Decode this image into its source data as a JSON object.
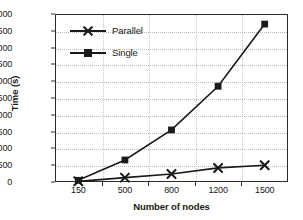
{
  "chart_data": {
    "type": "line",
    "title": "",
    "xlabel": "Number of nodes",
    "ylabel": "Time (s)",
    "categories": [
      "150",
      "500",
      "800",
      "1200",
      "1500"
    ],
    "x": [
      150,
      500,
      800,
      1200,
      1500
    ],
    "series": [
      {
        "name": "Parallel",
        "marker": "x",
        "values": [
          20,
          130,
          240,
          420,
          500
        ]
      },
      {
        "name": "Single",
        "marker": "square",
        "values": [
          50,
          655,
          1550,
          2850,
          4700
        ]
      }
    ],
    "ylim": [
      0,
      5000
    ],
    "ytick_step": 500,
    "yticks": [
      "0",
      "500",
      "1000",
      "1500",
      "2000",
      "2500",
      "3000",
      "3500",
      "4000",
      "4500",
      "5000"
    ],
    "grid": "horizontal-and-vertical-dotted",
    "legend_position": "upper-left-inside",
    "line_color": "#1a1a1a",
    "grid_color": "#b9b9b9",
    "axis_color": "#2b2b2b"
  },
  "legend": {
    "items": [
      {
        "label": "Parallel"
      },
      {
        "label": "Single"
      }
    ]
  },
  "axes": {
    "x_title": "Number of nodes",
    "y_title": "Time (s)"
  }
}
